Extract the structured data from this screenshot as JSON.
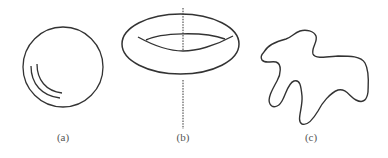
{
  "figure": {
    "panels": [
      {
        "id": "a",
        "label": "(a)",
        "shape": "sphere",
        "description": "circle with two curved highlight arcs in lower-left"
      },
      {
        "id": "b",
        "label": "(b)",
        "shape": "torus",
        "description": "ring/torus with dotted vertical axis of rotation"
      },
      {
        "id": "c",
        "label": "(c)",
        "shape": "irregular-blob",
        "description": "irregular closed curve"
      }
    ],
    "colors": {
      "stroke": "#333333",
      "background": "#ffffff",
      "label": "#555555"
    }
  }
}
